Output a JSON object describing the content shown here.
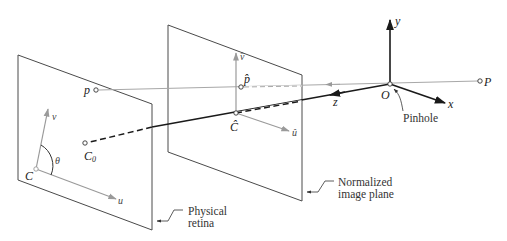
{
  "diagram": {
    "colors": {
      "plane_outline": "#4a4a4a",
      "axis_dark": "#1a1a1a",
      "axis_gray": "#9a9a9a",
      "ray_gray": "#a8a8a8",
      "text": "#222222"
    },
    "points": {
      "P": "P",
      "O": "O",
      "p": "p",
      "p_hat": "p̂",
      "C_hat": "Ĉ",
      "C0_main": "C",
      "C0_sub": "0",
      "C": "C"
    },
    "axes": {
      "x": "x",
      "y": "y",
      "z": "z",
      "u": "u",
      "v": "v",
      "u_hat": "û",
      "v_hat": "v̂",
      "theta": "θ"
    },
    "callouts": {
      "pinhole": "Pinhole",
      "normalized_line1": "Normalized",
      "normalized_line2": "image plane",
      "physical_line1": "Physical",
      "physical_line2": "retina"
    }
  }
}
